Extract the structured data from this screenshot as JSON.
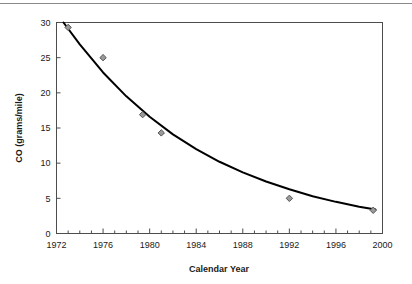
{
  "chart_data": {
    "type": "scatter",
    "title": "",
    "xlabel": "Calendar Year",
    "ylabel": "CO (grams/mile)",
    "xlim": [
      1972,
      2000
    ],
    "ylim": [
      0,
      30
    ],
    "xticks": [
      1972,
      1976,
      1980,
      1984,
      1988,
      1992,
      1996,
      2000
    ],
    "xtick_labels": [
      "1972",
      "1976",
      "1980",
      "1984",
      "1988",
      "1992",
      "1996",
      "2000"
    ],
    "x_minor_tick_step": 1,
    "yticks": [
      0,
      5,
      10,
      15,
      20,
      25,
      30
    ],
    "ytick_labels": [
      "0",
      "5",
      "10",
      "15",
      "20",
      "25",
      "30"
    ],
    "grid": false,
    "legend": "none",
    "series": [
      {
        "name": "Measured CO emissions",
        "marker": "diamond",
        "marker_color": "#9a9a9a",
        "marker_edge_color": "#555555",
        "x": [
          1973,
          1976,
          1979.4,
          1981,
          1992,
          1999.2
        ],
        "y": [
          29.3,
          25.0,
          16.9,
          14.3,
          5.0,
          3.3
        ]
      },
      {
        "name": "Exponential fit",
        "type": "line",
        "line_color": "#000000",
        "line_width": 2,
        "x": [
          1972.6,
          1974,
          1976,
          1978,
          1980,
          1982,
          1984,
          1986,
          1988,
          1990,
          1992,
          1994,
          1996,
          1998,
          1999.4
        ],
        "y": [
          30.0,
          26.9,
          22.9,
          19.5,
          16.6,
          14.1,
          12.0,
          10.2,
          8.7,
          7.4,
          6.3,
          5.3,
          4.5,
          3.8,
          3.4
        ]
      }
    ]
  },
  "axes": {
    "x_axis_label": "Calendar Year",
    "y_axis_label": "CO (grams/mile)"
  }
}
